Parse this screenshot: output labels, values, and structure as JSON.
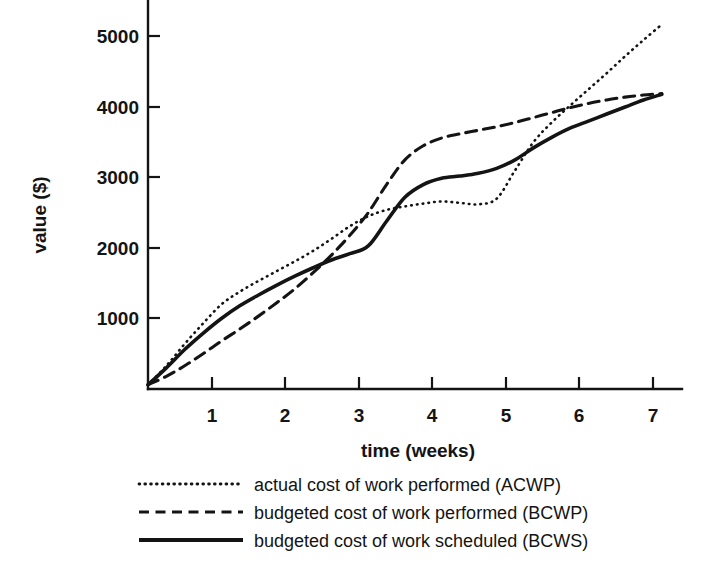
{
  "chart_data": {
    "type": "line",
    "title": "",
    "xlabel": "time (weeks)",
    "ylabel": "value ($)",
    "xlim": [
      0,
      7.15
    ],
    "ylim": [
      0,
      5520
    ],
    "grid": false,
    "legend_position": "below",
    "x_ticks": [
      1,
      2,
      3,
      4,
      5,
      6,
      7
    ],
    "x_tick_labels": [
      "1",
      "2",
      "3",
      "4",
      "5",
      "6",
      "7"
    ],
    "y_ticks": [
      1000,
      2000,
      3000,
      4000,
      5000
    ],
    "y_tick_labels": [
      "1000",
      "2000",
      "3000",
      "4000",
      "5000"
    ],
    "series": [
      {
        "name": "actual cost of work performed (ACWP)",
        "short_name": "ACWP",
        "style": "dotted",
        "x": [
          0,
          0.25,
          0.5,
          0.75,
          1.0,
          1.25,
          1.5,
          1.75,
          2.0,
          2.25,
          2.5,
          2.75,
          3.0,
          3.25,
          3.5,
          3.75,
          4.0,
          4.25,
          4.5,
          4.75,
          5.0,
          5.25,
          5.5,
          5.75,
          6.0,
          6.25,
          6.5,
          6.75,
          7.0
        ],
        "y": [
          60,
          330,
          640,
          930,
          1200,
          1380,
          1530,
          1670,
          1810,
          1960,
          2130,
          2310,
          2450,
          2540,
          2590,
          2630,
          2660,
          2640,
          2620,
          2700,
          3100,
          3500,
          3780,
          4020,
          4250,
          4480,
          4720,
          4950,
          5170
        ]
      },
      {
        "name": "budgeted cost of work performed (BCWP)",
        "short_name": "BCWP",
        "style": "dashed",
        "x": [
          0,
          0.25,
          0.5,
          0.75,
          1.0,
          1.25,
          1.5,
          1.75,
          2.0,
          2.25,
          2.5,
          2.75,
          3.0,
          3.25,
          3.5,
          3.75,
          4.0,
          4.25,
          4.5,
          4.75,
          5.0,
          5.25,
          5.5,
          5.75,
          6.0,
          6.25,
          6.5,
          6.75,
          7.0
        ],
        "y": [
          60,
          180,
          330,
          500,
          680,
          850,
          1030,
          1220,
          1420,
          1650,
          1900,
          2180,
          2500,
          2900,
          3250,
          3450,
          3560,
          3620,
          3670,
          3720,
          3780,
          3850,
          3920,
          3990,
          4050,
          4100,
          4140,
          4170,
          4190
        ]
      },
      {
        "name": "budgeted cost of work scheduled (BCWS)",
        "short_name": "BCWS",
        "style": "solid",
        "x": [
          0,
          0.25,
          0.5,
          0.75,
          1.0,
          1.25,
          1.5,
          1.75,
          2.0,
          2.25,
          2.5,
          2.75,
          3.0,
          3.25,
          3.5,
          3.75,
          4.0,
          4.25,
          4.5,
          4.75,
          5.0,
          5.25,
          5.5,
          5.75,
          6.0,
          6.25,
          6.5,
          6.75,
          7.0
        ],
        "y": [
          60,
          300,
          560,
          790,
          1000,
          1180,
          1330,
          1470,
          1600,
          1720,
          1830,
          1920,
          2030,
          2380,
          2720,
          2900,
          2990,
          3020,
          3060,
          3130,
          3250,
          3420,
          3570,
          3700,
          3800,
          3900,
          4000,
          4100,
          4180
        ]
      }
    ]
  },
  "legend": {
    "items": [
      {
        "label": "actual cost of work performed (ACWP)",
        "style": "dotted"
      },
      {
        "label": "budgeted cost of work performed (BCWP)",
        "style": "dashed"
      },
      {
        "label": "budgeted cost of work scheduled (BCWS)",
        "style": "solid"
      }
    ]
  }
}
